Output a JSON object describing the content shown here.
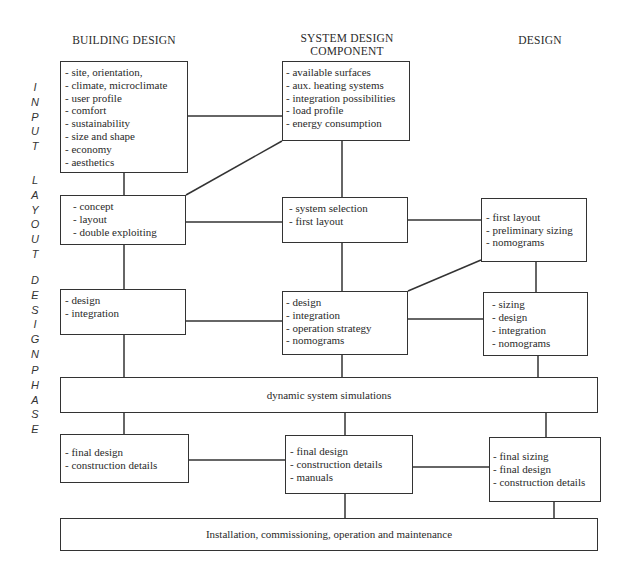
{
  "columns": {
    "left": "BUILDING DESIGN",
    "middle_line1": "SYSTEM DESIGN",
    "middle_line2": "COMPONENT",
    "right": "DESIGN"
  },
  "phase_label": {
    "input": [
      "I",
      "N",
      "P",
      "U",
      "T"
    ],
    "layout": [
      "L",
      "A",
      "Y",
      "O",
      "U",
      "T"
    ],
    "design": [
      "D",
      "E",
      "S",
      "I",
      "G",
      "N"
    ],
    "phase": [
      "P",
      "H",
      "A",
      "S",
      "E"
    ]
  },
  "boxes": {
    "input_building": [
      "- site, orientation,",
      "- climate, microclimate",
      "- user profile",
      "- comfort",
      "- sustainability",
      "- size and shape",
      "- economy",
      "- aesthetics"
    ],
    "input_system": [
      "- available surfaces",
      "- aux. heating systems",
      "- integration possibilities",
      "- load profile",
      "- energy consumption"
    ],
    "layout_building": [
      "- concept",
      "- layout",
      "- double exploiting"
    ],
    "layout_system": [
      "- system selection",
      "- first layout"
    ],
    "layout_design": [
      "- first layout",
      "- preliminary sizing",
      "- nomograms"
    ],
    "design_building": [
      "- design",
      "- integration"
    ],
    "design_system": [
      "- design",
      "- integration",
      "- operation strategy",
      "- nomograms"
    ],
    "design_design": [
      "- sizing",
      "- design",
      "- integration",
      "- nomograms"
    ],
    "simulations": "dynamic system simulations",
    "final_building": [
      "- final design",
      "- construction details"
    ],
    "final_system": [
      "- final design",
      "- construction details",
      "- manuals"
    ],
    "final_design": [
      "- final sizing",
      "- final design",
      "- construction details"
    ],
    "installation": "Installation, commissioning, operation and maintenance"
  }
}
